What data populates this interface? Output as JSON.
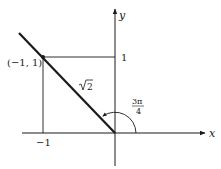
{
  "diagram": {
    "type": "unit-circle-angle",
    "axes": {
      "x_label": "x",
      "y_label": "y"
    },
    "ticks": {
      "y_tick_label": "1",
      "x_tick_label": "−1"
    },
    "point": {
      "label": "(−1, 1)",
      "x": -1,
      "y": 1
    },
    "segment_length_label": "√2",
    "sqrt_symbol": "√",
    "sqrt_radicand": "2",
    "angle": {
      "numerator": "3π",
      "denominator": "4",
      "value": "3π/4"
    },
    "colors": {
      "line": "#1a1a1a",
      "background": "#ffffff"
    }
  }
}
